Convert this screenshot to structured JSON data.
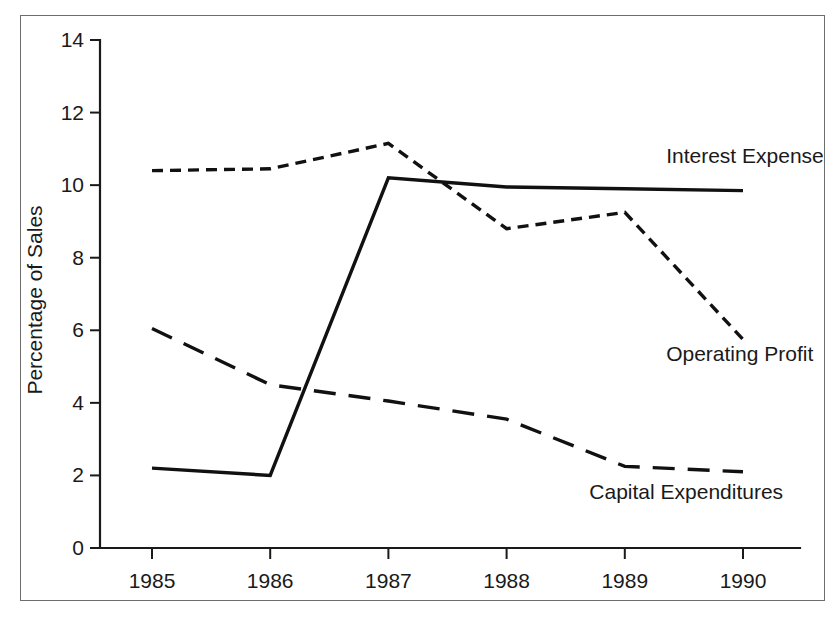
{
  "chart_data": {
    "type": "line",
    "title": "",
    "subtitle": "",
    "xlabel": "",
    "ylabel": "Percentage of Sales",
    "categories": [
      "1985",
      "1986",
      "1987",
      "1988",
      "1989",
      "1990"
    ],
    "x": [
      1985,
      1986,
      1987,
      1988,
      1989,
      1990
    ],
    "xlim": [
      1985,
      1990
    ],
    "ylim": [
      0,
      14
    ],
    "yticks": [
      0,
      2,
      4,
      6,
      8,
      10,
      12,
      14
    ],
    "ytick_labels": [
      "0",
      "2",
      "4",
      "6",
      "8",
      "10",
      "12",
      "14"
    ],
    "xticks": [
      1985,
      1986,
      1987,
      1988,
      1989,
      1990
    ],
    "xtick_labels": [
      "1985",
      "1986",
      "1987",
      "1988",
      "1989",
      "1990"
    ],
    "grid": false,
    "legend_position": "inline-right-annotations",
    "series": [
      {
        "name": "Interest Expense",
        "style": "solid",
        "color": "#111111",
        "values": [
          2.2,
          2.0,
          10.2,
          9.95,
          9.9,
          9.85
        ]
      },
      {
        "name": "Operating Profit",
        "style": "dotted-short-dash",
        "color": "#111111",
        "values": [
          10.4,
          10.45,
          11.15,
          8.8,
          9.25,
          5.75
        ]
      },
      {
        "name": "Capital Expenditures",
        "style": "long-dash",
        "color": "#111111",
        "values": [
          6.05,
          4.5,
          4.05,
          3.55,
          2.25,
          2.1
        ]
      }
    ],
    "annotations": [
      {
        "text": "Interest Expense",
        "x": 1989.35,
        "y": 10.6,
        "anchor": "start"
      },
      {
        "text": "Operating Profit",
        "x": 1989.35,
        "y": 5.15,
        "anchor": "start"
      },
      {
        "text": "Capital Expenditures",
        "x": 1988.7,
        "y": 1.35,
        "anchor": "start"
      }
    ]
  },
  "figure": {
    "axis_color": "#1a1a1a",
    "frame_color": "#6d6d6d",
    "background": "#ffffff"
  }
}
